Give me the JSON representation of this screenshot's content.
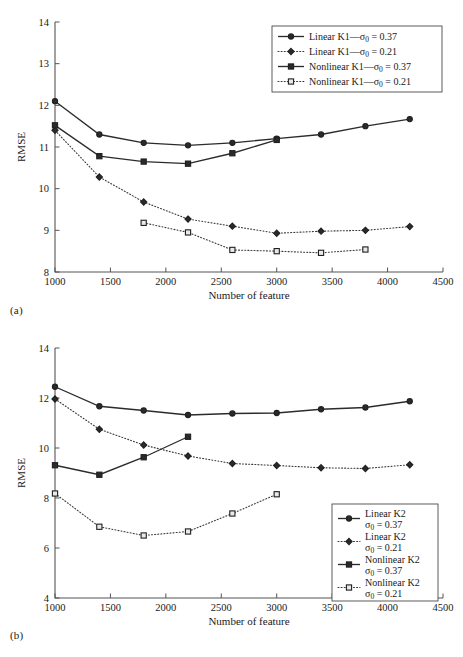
{
  "figure": {
    "panels": [
      {
        "caption": "(a)",
        "xlabel": "Number of feature",
        "ylabel": "RMSE"
      },
      {
        "caption": "(b)",
        "xlabel": "Number of feature",
        "ylabel": "RMSE"
      }
    ]
  },
  "chart_data": [
    {
      "type": "line",
      "panel": "(a)",
      "title": "",
      "xlabel": "Number of feature",
      "ylabel": "RMSE",
      "xlim": [
        1000,
        4500
      ],
      "ylim": [
        8,
        14
      ],
      "xticks": [
        1000,
        1500,
        2000,
        2500,
        3000,
        3500,
        4000,
        4500
      ],
      "yticks": [
        8,
        9,
        10,
        11,
        12,
        13,
        14
      ],
      "xtick_labels": [
        "1000",
        "1500",
        "2000",
        "2500",
        "3000",
        "3500",
        "4000",
        "4500"
      ],
      "ytick_labels": [
        "8",
        "9",
        "10",
        "11",
        "12",
        "13",
        "14"
      ],
      "grid": false,
      "legend_position": "top-right",
      "series": [
        {
          "name": "Linear K1—σ₀ = 0.37",
          "label_parts": [
            "Linear K1—",
            "σ",
            "0",
            " = 0.37"
          ],
          "linestyle": "solid",
          "marker": "circle",
          "marker_fill": "dark",
          "x": [
            1000,
            1400,
            1800,
            2200,
            2600,
            3000,
            3400,
            3800,
            4200
          ],
          "values": [
            12.1,
            11.3,
            11.1,
            11.04,
            11.1,
            11.2,
            11.3,
            11.5,
            11.67
          ]
        },
        {
          "name": "Linear K1—σ₀ = 0.21",
          "label_parts": [
            "Linear K1—",
            "σ",
            "0",
            " = 0.21"
          ],
          "linestyle": "dotted",
          "marker": "diamond",
          "marker_fill": "dark",
          "x": [
            1000,
            1400,
            1800,
            2200,
            2600,
            3000,
            3400,
            3800,
            4200
          ],
          "values": [
            11.4,
            10.28,
            9.68,
            9.27,
            9.1,
            8.93,
            8.98,
            9.0,
            9.09
          ]
        },
        {
          "name": "Nonlinear K1—σ₀ = 0.37",
          "label_parts": [
            "Nonlinear K1—",
            "σ",
            "0",
            " = 0.37"
          ],
          "linestyle": "solid",
          "marker": "square",
          "marker_fill": "dark",
          "x": [
            1000,
            1400,
            1800,
            2200,
            2600,
            3000
          ],
          "values": [
            11.52,
            10.78,
            10.65,
            10.6,
            10.85,
            11.17
          ]
        },
        {
          "name": "Nonlinear K1—σ₀ = 0.21",
          "label_parts": [
            "Nonlinear K1—",
            "σ",
            "0",
            " = 0.21"
          ],
          "linestyle": "dotted",
          "marker": "square",
          "marker_fill": "light",
          "x": [
            1800,
            2200,
            2600,
            3000,
            3400,
            3800
          ],
          "values": [
            9.18,
            8.95,
            8.53,
            8.5,
            8.46,
            8.54
          ]
        }
      ]
    },
    {
      "type": "line",
      "panel": "(b)",
      "title": "",
      "xlabel": "Number of feature",
      "ylabel": "RMSE",
      "xlim": [
        1000,
        4500
      ],
      "ylim": [
        4,
        14
      ],
      "xticks": [
        1000,
        1500,
        2000,
        2500,
        3000,
        3500,
        4000,
        4500
      ],
      "yticks": [
        4,
        6,
        8,
        10,
        12,
        14
      ],
      "xtick_labels": [
        "1000",
        "1500",
        "2000",
        "2500",
        "3000",
        "3500",
        "4000",
        "4500"
      ],
      "ytick_labels": [
        "4",
        "6",
        "8",
        "10",
        "12",
        "14"
      ],
      "grid": false,
      "legend_position": "bottom-right",
      "series": [
        {
          "name": "Linear K2 σ₀ = 0.37",
          "label_parts": [
            "Linear K2",
            "σ",
            "0",
            " = 0.37"
          ],
          "linestyle": "solid",
          "marker": "circle",
          "marker_fill": "dark",
          "x": [
            1000,
            1400,
            1800,
            2200,
            2600,
            3000,
            3400,
            3800,
            4200
          ],
          "values": [
            12.45,
            11.67,
            11.5,
            11.32,
            11.38,
            11.4,
            11.55,
            11.62,
            11.87
          ]
        },
        {
          "name": "Linear K2 σ₀ = 0.21",
          "label_parts": [
            "Linear K2",
            "σ",
            "0",
            " = 0.21"
          ],
          "linestyle": "dotted",
          "marker": "diamond",
          "marker_fill": "dark",
          "x": [
            1000,
            1400,
            1800,
            2200,
            2600,
            3000,
            3400,
            3800,
            4200
          ],
          "values": [
            11.96,
            10.75,
            10.12,
            9.68,
            9.38,
            9.3,
            9.21,
            9.18,
            9.33
          ]
        },
        {
          "name": "Nonlinear K2 σ₀ = 0.37",
          "label_parts": [
            "Nonlinear K2",
            "σ",
            "0",
            " = 0.37"
          ],
          "linestyle": "solid",
          "marker": "square",
          "marker_fill": "dark",
          "x": [
            1000,
            1400,
            1800,
            2200
          ],
          "values": [
            9.31,
            8.93,
            9.63,
            10.45
          ]
        },
        {
          "name": "Nonlinear K2 σ₀ = 0.21",
          "label_parts": [
            "Nonlinear K2",
            "σ",
            "0",
            " = 0.21"
          ],
          "linestyle": "dotted",
          "marker": "square",
          "marker_fill": "light",
          "x": [
            1000,
            1400,
            1800,
            2200,
            2600,
            3000
          ],
          "values": [
            8.18,
            6.85,
            6.5,
            6.66,
            7.38,
            8.15
          ]
        }
      ]
    }
  ],
  "colors": {
    "axis": "#555555",
    "series_solid": "#2b2b2b",
    "series_dotted": "#3a3a3a",
    "background": "#ffffff",
    "text": "#1a1a1a"
  }
}
